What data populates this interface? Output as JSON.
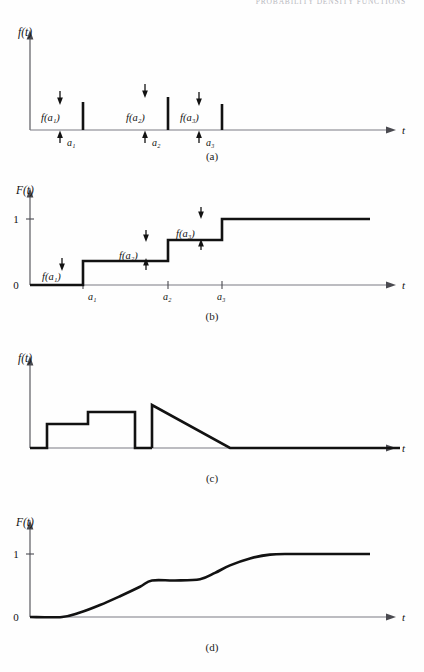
{
  "running_head": "PROBABILITY DENSITY FUNCTIONS",
  "figure": {
    "panels": [
      {
        "id": "a",
        "caption": "(a)",
        "yaxis_label": "f(t)",
        "xaxis_label": "t",
        "type": "discrete-density-impulses",
        "point_labels": [
          "f(a₁)",
          "f(a₂)",
          "f(a₃)"
        ],
        "tick_labels": [
          "a₁",
          "a₂",
          "a₃"
        ]
      },
      {
        "id": "b",
        "caption": "(b)",
        "yaxis_label": "F(t)",
        "xaxis_label": "t",
        "type": "discrete-distribution-staircase",
        "ytick_labels": [
          "1",
          "0"
        ],
        "jump_labels": [
          "f(a₁)",
          "f(a₂)",
          "f(a₃)"
        ],
        "tick_labels": [
          "a₁",
          "a₂",
          "a₃"
        ]
      },
      {
        "id": "c",
        "caption": "(c)",
        "yaxis_label": "f(t)",
        "xaxis_label": "t",
        "type": "continuous-density-piecewise"
      },
      {
        "id": "d",
        "caption": "(d)",
        "yaxis_label": "F(t)",
        "xaxis_label": "t",
        "type": "continuous-distribution-ogive",
        "ytick_labels": [
          "1",
          "0"
        ]
      }
    ]
  },
  "chart_data": [
    {
      "type": "bar",
      "panel": "a",
      "title": "f(t)",
      "xlabel": "t",
      "ylabel": "f(t)",
      "categories": [
        "a1",
        "a2",
        "a3"
      ],
      "values": [
        0.36,
        0.43,
        0.33
      ],
      "x_positions": [
        83,
        168,
        222
      ],
      "annotations": [
        "f(a1)",
        "f(a2)",
        "f(a3)"
      ],
      "grid": false,
      "legend": "none",
      "note": "probability mass impulses at a1, a2, a3; baseline f(t)=0 elsewhere"
    },
    {
      "type": "line",
      "panel": "b",
      "title": "F(t)",
      "xlabel": "t",
      "ylabel": "F(t)",
      "x": [
        30,
        83,
        83,
        168,
        168,
        222,
        222,
        370
      ],
      "y": [
        0,
        0,
        0.36,
        0.36,
        0.68,
        0.68,
        1.0,
        1.0
      ],
      "ylim": [
        0,
        1.08
      ],
      "ytick_values": [
        0,
        1
      ],
      "ytick_labels": [
        "0",
        "1"
      ],
      "xtick_labels": [
        "a1",
        "a2",
        "a3"
      ],
      "xtick_positions": [
        83,
        168,
        222
      ],
      "annotations": [
        "f(a1)",
        "f(a2)",
        "f(a3)"
      ],
      "grid": false,
      "legend": "none",
      "note": "right-continuous staircase CDF, jumps of size f(ai)"
    },
    {
      "type": "line",
      "panel": "c",
      "title": "f(t)",
      "xlabel": "t",
      "ylabel": "f(t)",
      "x": [
        30,
        47,
        47,
        88,
        88,
        135,
        135,
        152,
        152,
        160,
        230,
        400
      ],
      "y": [
        0,
        0,
        0.33,
        0.33,
        0.5,
        0.5,
        0,
        0,
        0,
        0.62,
        0,
        0
      ],
      "ylim": [
        0,
        1.0
      ],
      "grid": false,
      "legend": "none",
      "note": "piecewise density: two rectangles, gap, then a decreasing triangular ramp"
    },
    {
      "type": "line",
      "panel": "d",
      "title": "F(t)",
      "xlabel": "t",
      "ylabel": "F(t)",
      "x": [
        30,
        62,
        80,
        100,
        120,
        140,
        152,
        175,
        200,
        215,
        230,
        250,
        270,
        290,
        310,
        370
      ],
      "y": [
        0,
        0,
        0.07,
        0.19,
        0.33,
        0.48,
        0.58,
        0.58,
        0.6,
        0.7,
        0.82,
        0.93,
        0.99,
        1.0,
        1.0,
        1.0
      ],
      "ylim": [
        0,
        1.08
      ],
      "ytick_values": [
        0,
        1
      ],
      "ytick_labels": [
        "0",
        "1"
      ],
      "grid": false,
      "legend": "none",
      "note": "smooth ogive CDF rising 0 to 1 with a flat plateau near 0.58"
    }
  ]
}
